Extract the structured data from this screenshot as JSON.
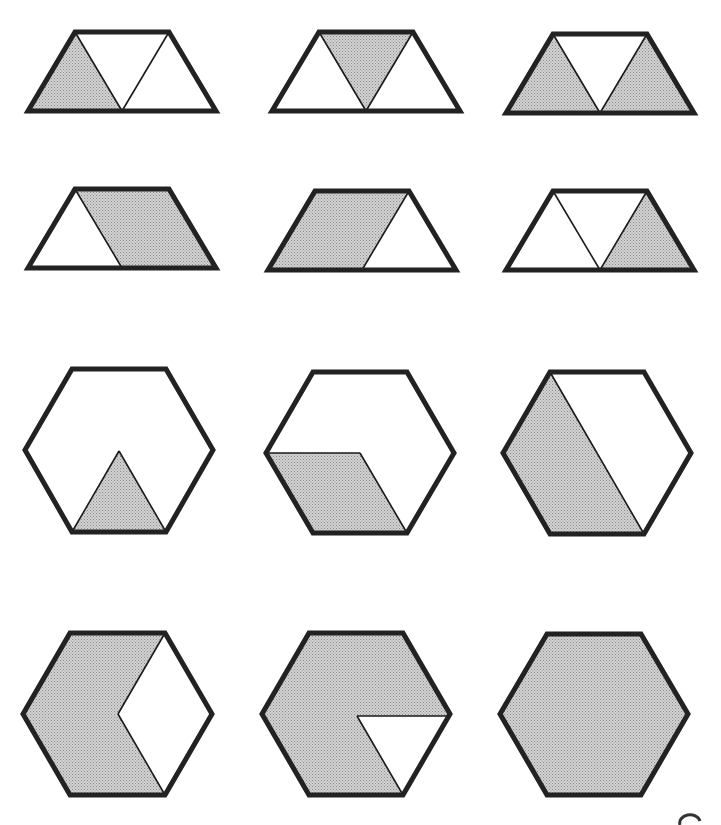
{
  "figure": {
    "colors": {
      "outline": "#222222",
      "shade_base": "#d0d0d0",
      "shade_dot": "#8a8a8a",
      "background": "#ffffff"
    },
    "rows": [
      {
        "shape": "trapezoid",
        "items": [
          {
            "id": "t1",
            "shaded": "left triangle",
            "fraction": "1/3"
          },
          {
            "id": "t2",
            "shaded": "middle triangle",
            "fraction": "1/3"
          },
          {
            "id": "t3",
            "shaded": "left and right triangles",
            "fraction": "2/3"
          }
        ]
      },
      {
        "shape": "trapezoid",
        "items": [
          {
            "id": "t4",
            "shaded": "right rhombus (middle + right triangles)",
            "fraction": "2/3"
          },
          {
            "id": "t5",
            "shaded": "left rhombus (left + middle triangles)",
            "fraction": "2/3"
          },
          {
            "id": "t6",
            "shaded": "right triangle",
            "fraction": "1/3"
          }
        ]
      },
      {
        "shape": "hexagon",
        "items": [
          {
            "id": "h1",
            "shaded": "one triangle",
            "fraction": "1/6"
          },
          {
            "id": "h2",
            "shaded": "one rhombus",
            "fraction": "2/6"
          },
          {
            "id": "h3",
            "shaded": "left half (trapezoid)",
            "fraction": "3/6"
          }
        ]
      },
      {
        "shape": "hexagon",
        "items": [
          {
            "id": "h4",
            "shaded": "all except one rhombus",
            "fraction": "4/6"
          },
          {
            "id": "h5",
            "shaded": "all except one triangle",
            "fraction": "5/6"
          },
          {
            "id": "h6",
            "shaded": "whole hexagon",
            "fraction": "6/6"
          }
        ]
      }
    ]
  }
}
